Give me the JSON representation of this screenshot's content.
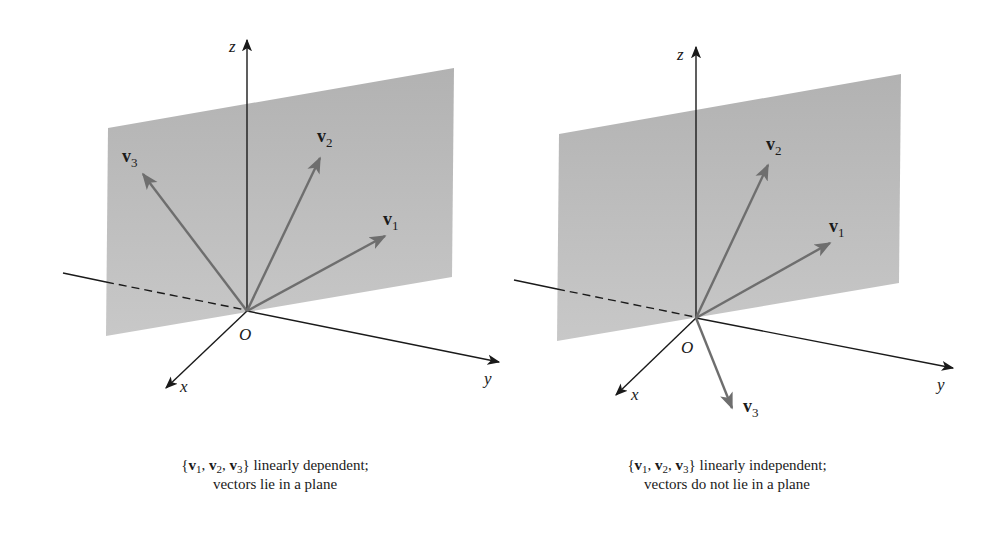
{
  "figures": [
    {
      "id": "dependent",
      "axes": {
        "x": "x",
        "y": "y",
        "z": "z",
        "origin": "O"
      },
      "vectors": [
        {
          "name": "v",
          "sub": "1"
        },
        {
          "name": "v",
          "sub": "2"
        },
        {
          "name": "v",
          "sub": "3"
        }
      ],
      "caption": {
        "set_open": "{",
        "v": "v",
        "s1": "1",
        "s2": "2",
        "s3": "3",
        "comma": ",",
        "set_close": "}",
        "line1_rest": " linearly dependent;",
        "line2": "vectors lie in a plane"
      }
    },
    {
      "id": "independent",
      "axes": {
        "x": "x",
        "y": "y",
        "z": "z",
        "origin": "O"
      },
      "vectors": [
        {
          "name": "v",
          "sub": "1"
        },
        {
          "name": "v",
          "sub": "2"
        },
        {
          "name": "v",
          "sub": "3"
        }
      ],
      "caption": {
        "set_open": "{",
        "v": "v",
        "s1": "1",
        "s2": "2",
        "s3": "3",
        "comma": ",",
        "set_close": "}",
        "line1_rest": " linearly independent;",
        "line2": "vectors do not lie in a plane"
      }
    }
  ],
  "colors": {
    "plane": "#b8b8b8",
    "vector": "#6e6e6e",
    "axis": "#1a1a1a"
  }
}
